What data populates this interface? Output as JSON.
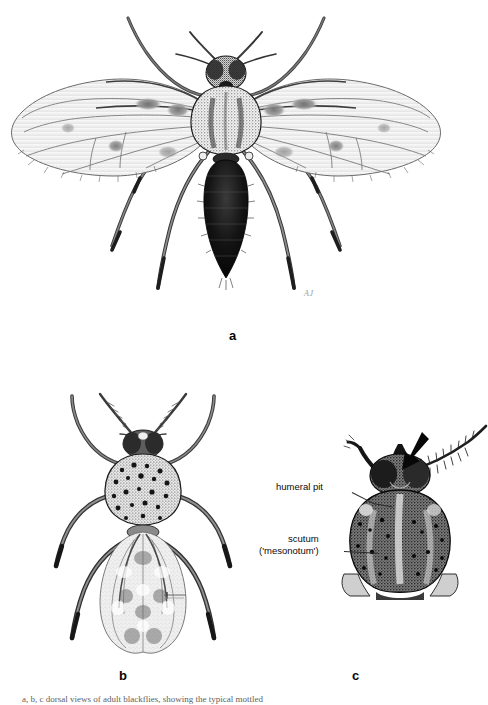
{
  "plate": {
    "type": "scientific-illustration-plate",
    "subject": "Blackflies (Diptera: Simuliidae) — adult morphology",
    "background_color": "#ffffff",
    "ink_color": "#1a1a1a"
  },
  "panels": [
    {
      "id": "a",
      "letter": "a",
      "view": "dorsal habitus, wings outspread",
      "description": "Adult blackfly with wings spread laterally, showing spotted wing membrane, stout stippled thorax, dark segmented abdomen and banded legs"
    },
    {
      "id": "b",
      "letter": "b",
      "view": "dorsal habitus, wings folded",
      "description": "Adult blackfly in dorsal view with wings folded over the abdomen, spotted scutum, feathered antennae"
    },
    {
      "id": "c",
      "letter": "c",
      "view": "thorax close-up, dorsal",
      "description": "Enlarged dorsal view of head and thorax showing humeral pits and mottled scutum; arrow indicates the antenna"
    }
  ],
  "labels": {
    "humeral_pit": "humeral  pit",
    "scutum_line1": "scutum",
    "scutum_line2": "('mesonotum')"
  },
  "markers": {
    "arrow": "black-arrow-pointing-down-left",
    "arrow_target": "antenna",
    "signature": "AJ"
  },
  "caption": {
    "text": "a, b, c  dorsal views of adult blackflies, showing the typical mottled"
  }
}
